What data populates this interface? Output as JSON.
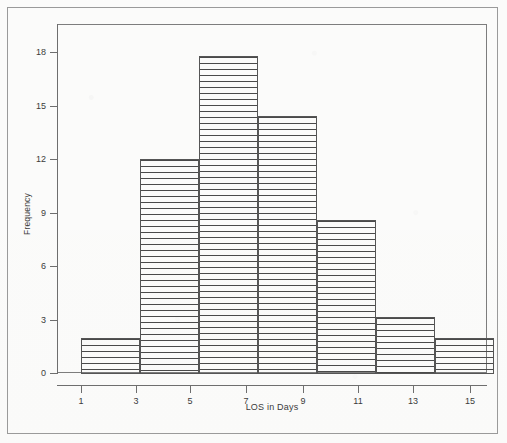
{
  "chart_data": {
    "type": "bar",
    "title": "",
    "subtitle": "",
    "xlabel": "LOS in Days",
    "ylabel": "Frequency",
    "categories": [
      "1-3",
      "3-5",
      "5-7",
      "7-9",
      "9-11",
      "11-13",
      "13-15"
    ],
    "bin_edges": [
      1,
      3,
      5,
      7,
      9,
      11,
      13,
      15
    ],
    "values": [
      2,
      12,
      17.8,
      14.4,
      8.6,
      3.2,
      2
    ],
    "xlim": [
      1,
      15
    ],
    "ylim": [
      0,
      18.5
    ],
    "xticks": [
      1,
      3,
      5,
      7,
      9,
      11,
      13,
      15
    ],
    "yticks": [
      0,
      3,
      6,
      9,
      12,
      15,
      18
    ],
    "xtick_labels": [
      "1",
      "3",
      "5",
      "7",
      "9",
      "11",
      "13",
      "15"
    ],
    "ytick_labels": [
      "0",
      "3",
      "6",
      "9",
      "12",
      "15",
      "18"
    ],
    "grid": false,
    "legend": null,
    "bar_fill": "horizontal-line-hatch",
    "bar_edge_color": "#555555",
    "bar_fill_color": "#4a4a4a",
    "axis_color": "#6e6e6e",
    "frame_color": "#9a9a9a",
    "background_color": "#fdfdfc"
  }
}
